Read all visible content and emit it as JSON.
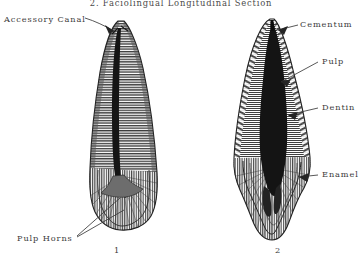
{
  "figure": {
    "title": "2.  Faciolingual  Longitudinal  Section",
    "background_color": "#ffffff",
    "ink_color": "#2b2b2b",
    "specimens": [
      {
        "number": "1",
        "name": "single-rooted-tooth-longitudinal-section",
        "description": "Narrow conical root with slender pulp canal, crown at bottom"
      },
      {
        "number": "2",
        "name": "broad-rooted-tooth-longitudinal-section",
        "description": "Broad root with large dark pulp chamber and flared crown"
      }
    ]
  },
  "labels": {
    "accessory_canal": "Accessory Canal",
    "cementum": "Cementum",
    "pulp": "Pulp",
    "dentin": "Dentin",
    "enamel": "Enamel",
    "pulp_horns": "Pulp Horns"
  },
  "figure_numbers": {
    "left": "1",
    "right": "2"
  },
  "legend_targets": [
    {
      "label": "Accessory Canal",
      "points_to": "root-apex-left-tooth",
      "side": "left"
    },
    {
      "label": "Pulp Horns",
      "points_to": "crown-pulp-horns-left-tooth",
      "side": "left"
    },
    {
      "label": "Cementum",
      "points_to": "root-surface-right-tooth",
      "side": "right"
    },
    {
      "label": "Pulp",
      "points_to": "pulp-chamber-right-tooth",
      "side": "right"
    },
    {
      "label": "Dentin",
      "points_to": "dentin-body-right-tooth",
      "side": "right"
    },
    {
      "label": "Enamel",
      "points_to": "crown-enamel-right-tooth",
      "side": "right"
    }
  ]
}
